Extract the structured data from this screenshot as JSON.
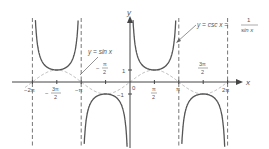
{
  "figure": {
    "type": "function-graph",
    "axes": {
      "x_label": "x",
      "y_label": "y",
      "x_ticks": [
        "-2π",
        "-3π/2",
        "-π",
        "-π/2",
        "0",
        "π/2",
        "π",
        "3π/2",
        "2π"
      ],
      "y_ticks": [
        "1",
        "-1"
      ]
    },
    "labels": {
      "sin": "y = sin x",
      "csc_lhs": "y = csc x =",
      "csc_num": "1",
      "csc_den": "sin x"
    },
    "tick_labels": {
      "neg2pi": "−2π",
      "neg3pi_num": "3π",
      "neg3pi_den": "2",
      "negpi": "−π",
      "neghalfpi_num": "π",
      "neghalfpi_den": "2",
      "zero": "0",
      "halfpi_num": "π",
      "halfpi_den": "2",
      "pi": "π",
      "threehalfpi_num": "3π",
      "threehalfpi_den": "2",
      "twopi": "2π",
      "one": "1",
      "negone": "−1",
      "minus": "−"
    },
    "asymptotes": [
      "-2π",
      "-π",
      "0",
      "π",
      "2π"
    ],
    "colors": {
      "csc_curve": "#555555",
      "sin_curve": "#aaaaaa",
      "axis": "#444444",
      "asymptote": "#777777"
    }
  }
}
